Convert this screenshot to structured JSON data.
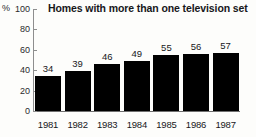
{
  "chart_data": {
    "type": "bar",
    "title": "Homes with more than one television set",
    "xlabel": "",
    "ylabel": "%",
    "categories": [
      "1981",
      "1982",
      "1983",
      "1984",
      "1985",
      "1986",
      "1987"
    ],
    "values": [
      34,
      39,
      46,
      49,
      55,
      56,
      57
    ],
    "value_labels": [
      "34",
      "39",
      "46",
      "49",
      "55",
      "56",
      "57"
    ],
    "ylim": [
      0,
      100
    ],
    "ytick_labels": [
      "100",
      "80",
      "60",
      "40",
      "20",
      "0"
    ],
    "ytick_values": [
      100,
      80,
      60,
      40,
      20,
      0
    ],
    "grid": false,
    "legend": "none",
    "bar_color": "#000000",
    "axis_color": "#8e8e8e",
    "text_color": "#17171a",
    "background_color": "#fdfdfb"
  }
}
